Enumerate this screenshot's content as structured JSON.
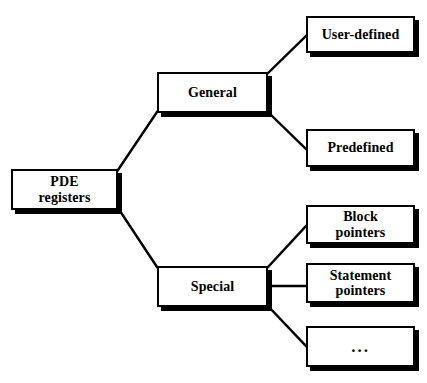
{
  "diagram": {
    "type": "tree",
    "style": {
      "background": "#ffffff",
      "node_fill": "#ffffff",
      "node_border": "#000000",
      "shadow_color": "#000000",
      "text_color": "#000000",
      "border_width_px": 2,
      "shadow_offset_px": 4
    },
    "nodes": [
      {
        "id": "pde-registers",
        "label": "PDE\nregisters",
        "level": 0,
        "x": 11,
        "y": 169,
        "w": 107,
        "h": 41
      },
      {
        "id": "general",
        "label": "General",
        "level": 1,
        "x": 157,
        "y": 72,
        "w": 111,
        "h": 41
      },
      {
        "id": "special",
        "label": "Special",
        "level": 1,
        "x": 157,
        "y": 266,
        "w": 111,
        "h": 41
      },
      {
        "id": "user-defined",
        "label": "User-defined",
        "level": 2,
        "x": 306,
        "y": 16,
        "w": 109,
        "h": 37
      },
      {
        "id": "predefined",
        "label": "Predefined",
        "level": 2,
        "x": 306,
        "y": 129,
        "w": 109,
        "h": 38
      },
      {
        "id": "block-pointers",
        "label": "Block\npointers",
        "level": 2,
        "x": 306,
        "y": 205,
        "w": 109,
        "h": 39
      },
      {
        "id": "statement-pointers",
        "label": "Statement\npointers",
        "level": 2,
        "x": 306,
        "y": 263,
        "w": 109,
        "h": 40
      },
      {
        "id": "ellipsis",
        "label": "...",
        "level": 2,
        "x": 306,
        "y": 326,
        "w": 109,
        "h": 41
      }
    ],
    "edges": [
      {
        "from": "pde-registers",
        "to": "general",
        "kind": "diagonal-up",
        "x1": 118,
        "y1": 170,
        "x2": 157,
        "y2": 112
      },
      {
        "from": "pde-registers",
        "to": "special",
        "kind": "diagonal-down",
        "x1": 118,
        "y1": 208,
        "x2": 157,
        "y2": 267
      },
      {
        "from": "general",
        "to": "user-defined",
        "kind": "diagonal-up",
        "x1": 268,
        "y1": 73,
        "x2": 306,
        "y2": 36
      },
      {
        "from": "general",
        "to": "predefined",
        "kind": "diagonal-down",
        "x1": 268,
        "y1": 112,
        "x2": 306,
        "y2": 149
      },
      {
        "from": "special",
        "to": "block-pointers",
        "kind": "diagonal-up",
        "x1": 268,
        "y1": 267,
        "x2": 306,
        "y2": 226
      },
      {
        "from": "special",
        "to": "statement-pointers",
        "kind": "horizontal",
        "x1": 268,
        "y1": 286,
        "x2": 306,
        "y2": 286
      },
      {
        "from": "special",
        "to": "ellipsis",
        "kind": "diagonal-down",
        "x1": 268,
        "y1": 306,
        "x2": 306,
        "y2": 346
      }
    ]
  }
}
